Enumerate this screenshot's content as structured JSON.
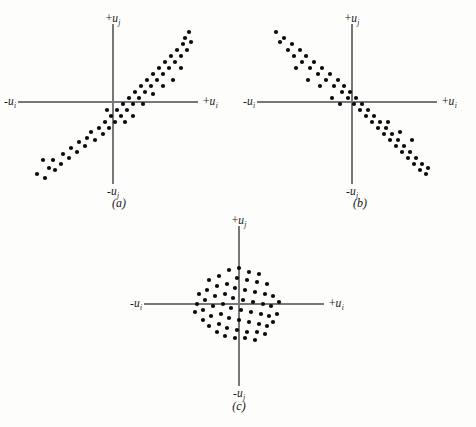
{
  "figure": {
    "background_color": "#fdfdfb",
    "axis_color": "#77787a",
    "dot_color": "#0b0b0b",
    "dot_radius": 2.1
  },
  "labels": {
    "positive_vertical": "+u",
    "negative_vertical": "-u",
    "positive_horizontal": "+u",
    "negative_horizontal": "-u",
    "vertical_subscript": "j",
    "horizontal_subscript": "i"
  },
  "panels": [
    {
      "id": "a",
      "caption": "(a)",
      "caption_x": 119,
      "caption_y": 196,
      "box": {
        "left": 10,
        "top": 8,
        "width": 228,
        "height": 185
      },
      "origin": {
        "x": 113,
        "y": 102
      },
      "axes": {
        "x_start": -95,
        "x_end": 85,
        "y_start": -82,
        "y_end": 78
      },
      "label_positions": {
        "top": {
          "x": 113,
          "y": 24
        },
        "bottom": {
          "x": 113,
          "y": 186
        },
        "left": {
          "x": 16,
          "y": 102
        },
        "right": {
          "x": 203,
          "y": 102
        }
      },
      "axis_label_top": "+u",
      "axis_label_bottom": "-u",
      "axis_label_left": "-u",
      "axis_label_right": "+u"
    },
    {
      "id": "b",
      "caption": "(b)",
      "caption_x": 360,
      "caption_y": 196,
      "box": {
        "left": 248,
        "top": 8,
        "width": 228,
        "height": 185
      },
      "origin": {
        "x": 352,
        "y": 102
      },
      "axes": {
        "x_start": -95,
        "x_end": 85,
        "y_start": -82,
        "y_end": 78
      },
      "label_positions": {
        "top": {
          "x": 352,
          "y": 24
        },
        "bottom": {
          "x": 352,
          "y": 186
        },
        "left": {
          "x": 255,
          "y": 102
        },
        "right": {
          "x": 442,
          "y": 102
        }
      },
      "axis_label_top": "+u",
      "axis_label_bottom": "-u",
      "axis_label_left": "-u",
      "axis_label_right": "+u"
    },
    {
      "id": "c",
      "caption": "(c)",
      "caption_x": 239,
      "caption_y": 399,
      "box": {
        "left": 125,
        "top": 210,
        "width": 230,
        "height": 185
      },
      "origin": {
        "x": 239,
        "y": 304
      },
      "axes": {
        "x_start": -95,
        "x_end": 85,
        "y_start": -82,
        "y_end": 78
      },
      "label_positions": {
        "top": {
          "x": 239,
          "y": 226
        },
        "bottom": {
          "x": 239,
          "y": 388
        },
        "left": {
          "x": 142,
          "y": 304
        },
        "right": {
          "x": 329,
          "y": 304
        }
      },
      "axis_label_top": "+u",
      "axis_label_bottom": "-u",
      "axis_label_left": "-u",
      "axis_label_right": "+u"
    }
  ],
  "chart_data": [
    {
      "type": "scatter",
      "panel": "a",
      "title": "(a)",
      "xlabel": "u_i",
      "ylabel": "u_j",
      "correlation": "positive",
      "description": "Elongated elliptical cloud oriented along the +45 degree diagonal, indicating a high positive correlation between u_i and u_j.",
      "xlim": [
        -95,
        85
      ],
      "ylim": [
        -82,
        78
      ],
      "grid": false,
      "legend": "none",
      "points": [
        [
          -76,
          -72
        ],
        [
          -68,
          -76
        ],
        [
          -64,
          -66
        ],
        [
          -60,
          -58
        ],
        [
          -70,
          -58
        ],
        [
          -58,
          -68
        ],
        [
          -52,
          -62
        ],
        [
          -50,
          -52
        ],
        [
          -44,
          -56
        ],
        [
          -42,
          -46
        ],
        [
          -36,
          -50
        ],
        [
          -34,
          -40
        ],
        [
          -28,
          -44
        ],
        [
          -26,
          -36
        ],
        [
          -22,
          -30
        ],
        [
          -18,
          -38
        ],
        [
          -14,
          -26
        ],
        [
          -10,
          -32
        ],
        [
          -8,
          -20
        ],
        [
          -4,
          -26
        ],
        [
          -2,
          -14
        ],
        [
          2,
          -20
        ],
        [
          4,
          -8
        ],
        [
          8,
          -14
        ],
        [
          10,
          -2
        ],
        [
          14,
          -8
        ],
        [
          16,
          4
        ],
        [
          20,
          -2
        ],
        [
          22,
          10
        ],
        [
          26,
          4
        ],
        [
          28,
          16
        ],
        [
          32,
          10
        ],
        [
          34,
          22
        ],
        [
          38,
          16
        ],
        [
          40,
          28
        ],
        [
          44,
          22
        ],
        [
          46,
          34
        ],
        [
          50,
          28
        ],
        [
          52,
          40
        ],
        [
          56,
          34
        ],
        [
          58,
          46
        ],
        [
          62,
          40
        ],
        [
          64,
          52
        ],
        [
          68,
          46
        ],
        [
          70,
          58
        ],
        [
          74,
          52
        ],
        [
          72,
          64
        ],
        [
          78,
          60
        ],
        [
          76,
          70
        ],
        [
          68,
          34
        ],
        [
          60,
          22
        ],
        [
          50,
          16
        ],
        [
          40,
          8
        ],
        [
          30,
          -2
        ],
        [
          20,
          -14
        ],
        [
          12,
          -20
        ],
        [
          -6,
          -8
        ]
      ]
    },
    {
      "type": "scatter",
      "panel": "b",
      "title": "(b)",
      "xlabel": "u_i",
      "ylabel": "u_j",
      "correlation": "negative",
      "description": "Elongated elliptical cloud oriented along the -45 degree diagonal, indicating a high negative correlation between u_i and u_j.",
      "xlim": [
        -95,
        85
      ],
      "ylim": [
        -82,
        78
      ],
      "grid": false,
      "legend": "none",
      "points": [
        [
          -76,
          70
        ],
        [
          -72,
          60
        ],
        [
          -68,
          64
        ],
        [
          -64,
          52
        ],
        [
          -60,
          58
        ],
        [
          -58,
          46
        ],
        [
          -52,
          52
        ],
        [
          -50,
          40
        ],
        [
          -46,
          46
        ],
        [
          -42,
          34
        ],
        [
          -38,
          40
        ],
        [
          -34,
          28
        ],
        [
          -30,
          34
        ],
        [
          -26,
          22
        ],
        [
          -22,
          28
        ],
        [
          -18,
          16
        ],
        [
          -14,
          22
        ],
        [
          -10,
          10
        ],
        [
          -8,
          16
        ],
        [
          -4,
          4
        ],
        [
          -2,
          10
        ],
        [
          2,
          -2
        ],
        [
          4,
          4
        ],
        [
          8,
          -8
        ],
        [
          10,
          -2
        ],
        [
          14,
          -14
        ],
        [
          16,
          -8
        ],
        [
          20,
          -20
        ],
        [
          22,
          -14
        ],
        [
          26,
          -26
        ],
        [
          28,
          -20
        ],
        [
          32,
          -32
        ],
        [
          34,
          -26
        ],
        [
          38,
          -38
        ],
        [
          40,
          -32
        ],
        [
          44,
          -44
        ],
        [
          46,
          -38
        ],
        [
          50,
          -50
        ],
        [
          52,
          -44
        ],
        [
          56,
          -56
        ],
        [
          58,
          -50
        ],
        [
          62,
          -62
        ],
        [
          64,
          -56
        ],
        [
          68,
          -68
        ],
        [
          70,
          -62
        ],
        [
          74,
          -72
        ],
        [
          76,
          -66
        ],
        [
          -56,
          34
        ],
        [
          -44,
          22
        ],
        [
          -32,
          16
        ],
        [
          -20,
          4
        ],
        [
          -12,
          -2
        ],
        [
          60,
          -38
        ],
        [
          48,
          -30
        ],
        [
          36,
          -20
        ]
      ]
    },
    {
      "type": "scatter",
      "panel": "c",
      "title": "(c)",
      "xlabel": "u_i",
      "ylabel": "u_j",
      "correlation": "zero",
      "description": "Roughly circular cloud of points centered on the origin, indicating no correlation between u_i and u_j.",
      "xlim": [
        -95,
        85
      ],
      "ylim": [
        -82,
        78
      ],
      "grid": false,
      "legend": "none",
      "points": [
        [
          -10,
          34
        ],
        [
          0,
          36
        ],
        [
          10,
          32
        ],
        [
          20,
          30
        ],
        [
          -20,
          28
        ],
        [
          -30,
          24
        ],
        [
          -2,
          26
        ],
        [
          8,
          24
        ],
        [
          18,
          22
        ],
        [
          28,
          20
        ],
        [
          -12,
          20
        ],
        [
          -22,
          18
        ],
        [
          -32,
          14
        ],
        [
          -40,
          10
        ],
        [
          -4,
          16
        ],
        [
          6,
          14
        ],
        [
          16,
          12
        ],
        [
          26,
          10
        ],
        [
          34,
          8
        ],
        [
          -14,
          10
        ],
        [
          -24,
          8
        ],
        [
          -34,
          4
        ],
        [
          -42,
          0
        ],
        [
          -6,
          6
        ],
        [
          4,
          4
        ],
        [
          14,
          2
        ],
        [
          24,
          0
        ],
        [
          32,
          -2
        ],
        [
          40,
          2
        ],
        [
          -16,
          0
        ],
        [
          -26,
          -2
        ],
        [
          -36,
          -6
        ],
        [
          -44,
          -8
        ],
        [
          -8,
          -4
        ],
        [
          2,
          -6
        ],
        [
          12,
          -8
        ],
        [
          22,
          -10
        ],
        [
          30,
          -12
        ],
        [
          38,
          -10
        ],
        [
          -18,
          -10
        ],
        [
          -28,
          -12
        ],
        [
          -36,
          -16
        ],
        [
          -10,
          -14
        ],
        [
          0,
          -16
        ],
        [
          10,
          -18
        ],
        [
          20,
          -20
        ],
        [
          28,
          -22
        ],
        [
          34,
          -18
        ],
        [
          -20,
          -20
        ],
        [
          -30,
          -22
        ],
        [
          -12,
          -24
        ],
        [
          -2,
          -26
        ],
        [
          8,
          -28
        ],
        [
          18,
          -28
        ],
        [
          26,
          -30
        ],
        [
          -22,
          -28
        ],
        [
          -4,
          -34
        ],
        [
          6,
          -34
        ],
        [
          16,
          -36
        ],
        [
          -14,
          -32
        ]
      ]
    }
  ]
}
